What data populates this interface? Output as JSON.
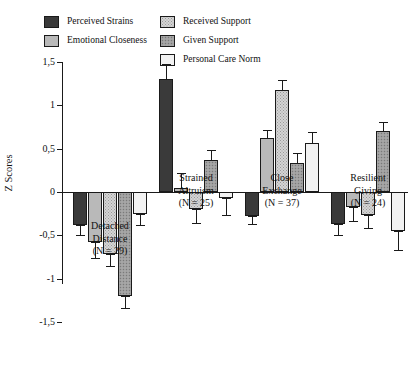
{
  "chart_data": {
    "type": "bar",
    "title": "",
    "xlabel": "",
    "ylabel": "Z Scores",
    "ylim": [
      -1.5,
      1.5
    ],
    "ytick_labels": [
      "1,5",
      "1",
      "0,5",
      "0",
      "-0,5",
      "-1",
      "-1,5"
    ],
    "yticks": [
      1.5,
      1.0,
      0.5,
      0.0,
      -0.5,
      -1.0,
      -1.5
    ],
    "grid": false,
    "legend_position": "top",
    "error_bars": "standard error",
    "categories": [
      "Detached Distance",
      "Strained Altruism",
      "Close Exchange",
      "Resilient Giving"
    ],
    "category_n": [
      "(N = 29)",
      "(N = 25)",
      "(N = 37)",
      "(N = 24)"
    ],
    "series": [
      {
        "name": "Perceived Strains",
        "fill": "f-strain",
        "color": "#3a3a3a",
        "values": [
          -0.38,
          1.3,
          -0.28,
          -0.37
        ],
        "errors": [
          0.12,
          0.18,
          0.09,
          0.13
        ]
      },
      {
        "name": "Emotional Closeness",
        "fill": "f-emot",
        "color": "#b9b9b9",
        "values": [
          -0.58,
          0.05,
          0.62,
          -0.17
        ],
        "errors": [
          0.18,
          0.17,
          0.1,
          0.16
        ]
      },
      {
        "name": "Received Support",
        "fill": "f-recv",
        "color": "#d4d4d4",
        "values": [
          -0.72,
          -0.2,
          1.18,
          -0.27
        ],
        "errors": [
          0.13,
          0.16,
          0.11,
          0.14
        ]
      },
      {
        "name": "Given Support",
        "fill": "f-give",
        "color": "#9e9e9e",
        "values": [
          -1.2,
          0.37,
          0.33,
          0.7
        ],
        "errors": [
          0.14,
          0.11,
          0.12,
          0.11
        ]
      },
      {
        "name": "Personal Care Norm",
        "fill": "f-pcn",
        "color": "#f2f2f2",
        "values": [
          -0.25,
          -0.07,
          0.57,
          -0.45
        ],
        "errors": [
          0.13,
          0.19,
          0.12,
          0.22
        ]
      }
    ]
  }
}
